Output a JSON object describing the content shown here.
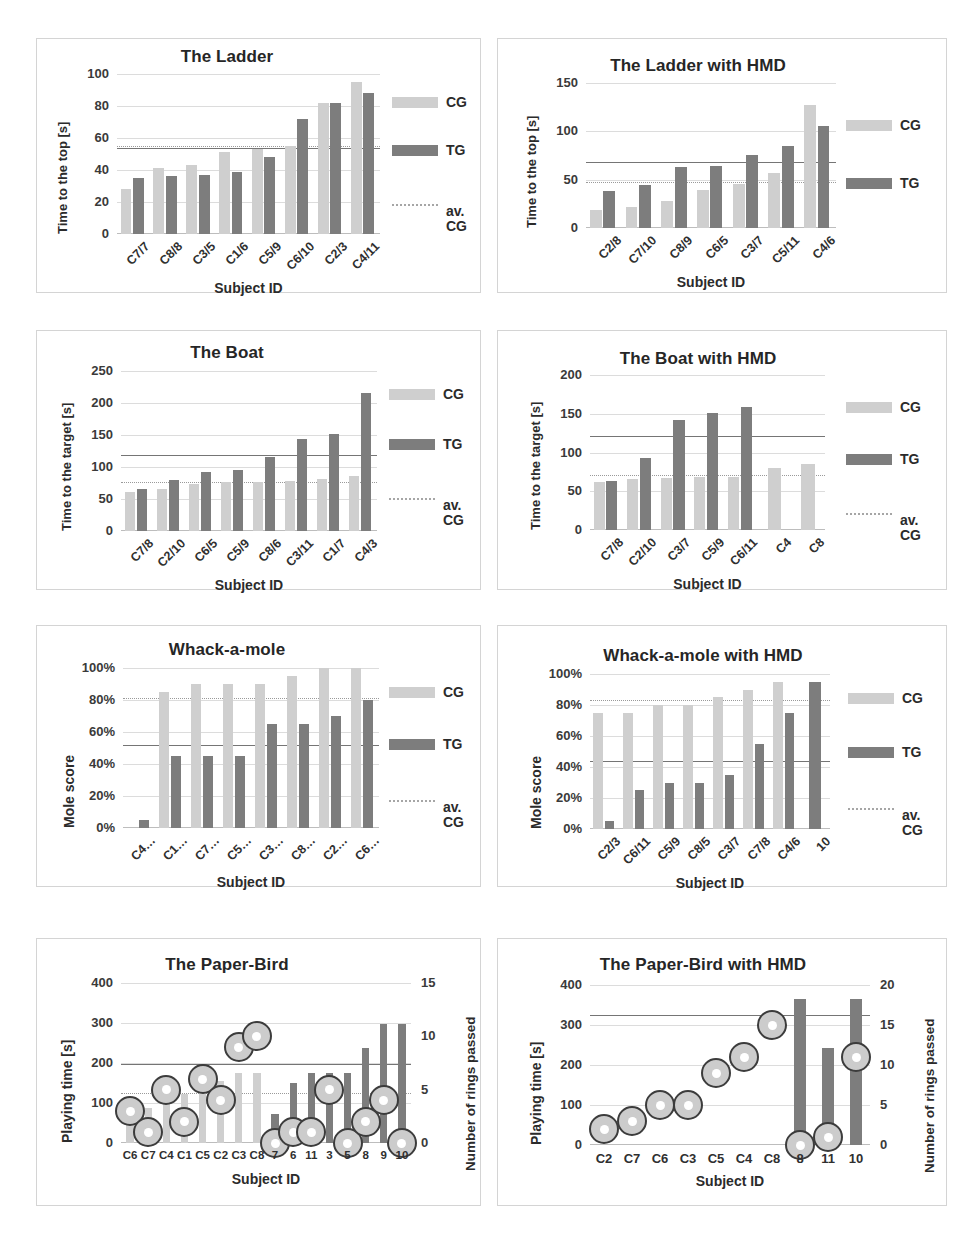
{
  "figure": {
    "panel_count": 8,
    "legend": {
      "cg_label": "CG",
      "tg_label": "TG",
      "avcg_label_line1": "av.",
      "avcg_label_line2": "CG",
      "cg_color": "#cfcfcf",
      "tg_color": "#7d7d7d",
      "avcg_color": "#a6a6a6"
    },
    "common": {
      "xlabel": "Subject ID"
    }
  },
  "chart_data": [
    {
      "id": "ladder",
      "type": "bar",
      "title": "The Ladder",
      "xlabel": "Subject ID",
      "ylabel": "Time to the top [s]",
      "ylim": [
        0,
        100
      ],
      "yticks": [
        0,
        20,
        40,
        60,
        80,
        100
      ],
      "ytick_labels": [
        "0",
        "20",
        "40",
        "60",
        "80",
        "100"
      ],
      "grid": true,
      "legend_position": "right",
      "legend_items": [
        "CG",
        "TG",
        "av. CG"
      ],
      "categories": [
        "C7/7",
        "C8/8",
        "C3/5",
        "C1/6",
        "C5/9",
        "C6/10",
        "C2/3",
        "C4/11"
      ],
      "series": [
        {
          "name": "CG",
          "color": "#cfcfcf",
          "values": [
            28,
            41,
            43,
            51,
            53,
            55,
            82,
            95
          ]
        },
        {
          "name": "TG",
          "color": "#7d7d7d",
          "values": [
            35,
            36,
            37,
            39,
            48,
            72,
            82,
            88
          ]
        }
      ],
      "reference_lines": [
        {
          "name": "av. TG",
          "value": 54,
          "style": "solid",
          "color": "#757575"
        },
        {
          "name": "av. CG",
          "value": 55,
          "style": "dotted",
          "color": "#9a9a9a"
        }
      ]
    },
    {
      "id": "ladder-hmd",
      "type": "bar",
      "title": "The Ladder with HMD",
      "xlabel": "Subject ID",
      "ylabel": "Time to the top [s]",
      "ylim": [
        0,
        150
      ],
      "yticks": [
        0,
        50,
        100,
        150
      ],
      "ytick_labels": [
        "0",
        "50",
        "100",
        "150"
      ],
      "grid": true,
      "legend_position": "right",
      "legend_items": [
        "CG",
        "TG"
      ],
      "categories": [
        "C2/8",
        "C7/10",
        "C8/9",
        "C6/5",
        "C3/7",
        "C5/11",
        "C4/6"
      ],
      "series": [
        {
          "name": "CG",
          "color": "#cfcfcf",
          "values": [
            19,
            22,
            28,
            39,
            46,
            57,
            127
          ]
        },
        {
          "name": "TG",
          "color": "#7d7d7d",
          "values": [
            38,
            45,
            63,
            64,
            76,
            85,
            106
          ]
        }
      ],
      "reference_lines": [
        {
          "name": "av. TG",
          "value": 68,
          "style": "solid",
          "color": "#757575"
        },
        {
          "name": "av. CG",
          "value": 48,
          "style": "dotted",
          "color": "#9a9a9a"
        }
      ]
    },
    {
      "id": "boat",
      "type": "bar",
      "title": "The Boat",
      "xlabel": "Subject ID",
      "ylabel": "Time to the target [s]",
      "ylim": [
        0,
        250
      ],
      "yticks": [
        0,
        50,
        100,
        150,
        200,
        250
      ],
      "ytick_labels": [
        "0",
        "50",
        "100",
        "150",
        "200",
        "250"
      ],
      "grid": true,
      "legend_position": "right",
      "legend_items": [
        "CG",
        "TG",
        "av. CG"
      ],
      "categories": [
        "C7/8",
        "C2/10",
        "C6/5",
        "C5/9",
        "C8/6",
        "C3/11",
        "C1/7",
        "C4/3"
      ],
      "series": [
        {
          "name": "CG",
          "color": "#cfcfcf",
          "values": [
            61,
            65,
            74,
            76,
            77,
            78,
            82,
            86
          ]
        },
        {
          "name": "TG",
          "color": "#7d7d7d",
          "values": [
            65,
            80,
            92,
            95,
            115,
            143,
            151,
            215
          ]
        }
      ],
      "reference_lines": [
        {
          "name": "av. TG",
          "value": 119,
          "style": "solid",
          "color": "#757575"
        },
        {
          "name": "av. CG",
          "value": 77,
          "style": "dotted",
          "color": "#9a9a9a"
        }
      ]
    },
    {
      "id": "boat-hmd",
      "type": "bar",
      "title": "The Boat with HMD",
      "xlabel": "Subject ID",
      "ylabel": "Time to the target [s]",
      "ylim": [
        0,
        200
      ],
      "yticks": [
        0,
        50,
        100,
        150,
        200
      ],
      "ytick_labels": [
        "0",
        "50",
        "100",
        "150",
        "200"
      ],
      "grid": true,
      "legend_position": "right",
      "legend_items": [
        "CG",
        "TG",
        "av. CG"
      ],
      "categories": [
        "C7/8",
        "C2/10",
        "C3/7",
        "C5/9",
        "C6/11",
        "C4",
        "C8"
      ],
      "series": [
        {
          "name": "CG",
          "color": "#cfcfcf",
          "values": [
            62,
            66,
            67,
            68,
            68,
            80,
            85
          ]
        },
        {
          "name": "TG",
          "color": "#7d7d7d",
          "values": [
            63,
            93,
            142,
            151,
            159,
            null,
            null
          ]
        }
      ],
      "reference_lines": [
        {
          "name": "av. TG",
          "value": 121,
          "style": "solid",
          "color": "#757575"
        },
        {
          "name": "av. CG",
          "value": 71,
          "style": "dotted",
          "color": "#9a9a9a"
        }
      ]
    },
    {
      "id": "whack",
      "type": "bar",
      "title": "Whack-a-mole",
      "xlabel": "Subject ID",
      "ylabel": "Mole score",
      "ylim": [
        0,
        100
      ],
      "yticks": [
        0,
        20,
        40,
        60,
        80,
        100
      ],
      "ytick_labels": [
        "0%",
        "20%",
        "40%",
        "60%",
        "80%",
        "100%"
      ],
      "grid": true,
      "legend_position": "right",
      "legend_items": [
        "CG",
        "TG",
        "av. CG"
      ],
      "categories": [
        "C4…",
        "C1…",
        "C7…",
        "C5…",
        "C3…",
        "C8…",
        "C2…",
        "C6…"
      ],
      "series": [
        {
          "name": "CG",
          "color": "#cfcfcf",
          "values": [
            0,
            85,
            90,
            90,
            90,
            95,
            100,
            100
          ]
        },
        {
          "name": "TG",
          "color": "#7d7d7d",
          "values": [
            5,
            45,
            45,
            45,
            65,
            65,
            70,
            80
          ]
        }
      ],
      "reference_lines": [
        {
          "name": "av. TG",
          "value": 52,
          "style": "solid",
          "color": "#757575"
        },
        {
          "name": "av. CG",
          "value": 81,
          "style": "dotted",
          "color": "#9a9a9a"
        }
      ]
    },
    {
      "id": "whack-hmd",
      "type": "bar",
      "title": "Whack-a-mole with HMD",
      "xlabel": "Subject ID",
      "ylabel": "Mole score",
      "ylim": [
        0,
        100
      ],
      "yticks": [
        0,
        20,
        40,
        60,
        80,
        100
      ],
      "ytick_labels": [
        "0%",
        "20%",
        "40%",
        "60%",
        "80%",
        "100%"
      ],
      "grid": true,
      "legend_position": "right",
      "legend_items": [
        "CG",
        "TG",
        "av. CG"
      ],
      "categories": [
        "C2/3",
        "C6/11",
        "C5/9",
        "C8/5",
        "C3/7",
        "C7/8",
        "C4/6",
        "10"
      ],
      "series": [
        {
          "name": "CG",
          "color": "#cfcfcf",
          "values": [
            75,
            75,
            80,
            80,
            85,
            90,
            95,
            null
          ]
        },
        {
          "name": "TG",
          "color": "#7d7d7d",
          "values": [
            5,
            25,
            30,
            30,
            35,
            55,
            75,
            95
          ]
        }
      ],
      "reference_lines": [
        {
          "name": "av. TG",
          "value": 44,
          "style": "solid",
          "color": "#757575"
        },
        {
          "name": "av. CG",
          "value": 83,
          "style": "dotted",
          "color": "#9a9a9a"
        }
      ]
    },
    {
      "id": "paperbird",
      "type": "bar",
      "title": "The Paper-Bird",
      "xlabel": "Subject ID",
      "ylabel": "Playing time [s]",
      "y2label": "Number of rings passed",
      "ylim": [
        0,
        400
      ],
      "yticks": [
        0,
        100,
        200,
        300,
        400
      ],
      "ytick_labels": [
        "0",
        "100",
        "200",
        "300",
        "400"
      ],
      "y2lim": [
        0,
        15
      ],
      "y2ticks": [
        0,
        5,
        10,
        15
      ],
      "y2tick_labels": [
        "0",
        "5",
        "10",
        "15"
      ],
      "grid": true,
      "categories": [
        "C6",
        "C7",
        "C4",
        "C1",
        "C5",
        "C2",
        "C3",
        "C8",
        "7",
        "6",
        "11",
        "3",
        "5",
        "8",
        "9",
        "10"
      ],
      "series": [
        {
          "name": "Playing time CG",
          "color": "#cfcfcf",
          "values": [
            55,
            88,
            120,
            122,
            150,
            155,
            175,
            175,
            null,
            null,
            null,
            null,
            null,
            null,
            null,
            null
          ]
        },
        {
          "name": "Playing time TG",
          "color": "#7d7d7d",
          "values": [
            null,
            null,
            null,
            null,
            null,
            null,
            null,
            null,
            72,
            150,
            175,
            175,
            175,
            238,
            298,
            298
          ]
        },
        {
          "name": "Rings passed",
          "marker": "circle",
          "values": [
            3,
            1,
            5,
            2,
            6,
            4,
            9,
            10,
            0,
            1,
            1,
            5,
            0,
            2,
            4,
            0
          ]
        }
      ],
      "reference_lines": [
        {
          "name": "av. playing time",
          "value": 198,
          "style": "solid",
          "color": "#757575"
        },
        {
          "name": "av. rings",
          "value": 125,
          "style": "dotted",
          "color": "#9a9a9a"
        }
      ]
    },
    {
      "id": "paperbird-hmd",
      "type": "bar",
      "title": "The Paper-Bird with HMD",
      "xlabel": "Subject ID",
      "ylabel": "Playing time [s]",
      "y2label": "Number of rings passed",
      "ylim": [
        0,
        400
      ],
      "yticks": [
        0,
        100,
        200,
        300,
        400
      ],
      "ytick_labels": [
        "0",
        "100",
        "200",
        "300",
        "400"
      ],
      "y2lim": [
        0,
        20
      ],
      "y2ticks": [
        0,
        5,
        10,
        15,
        20
      ],
      "y2tick_labels": [
        "0",
        "5",
        "10",
        "15",
        "20"
      ],
      "grid": true,
      "categories": [
        "C2",
        "C7",
        "C6",
        "C3",
        "C5",
        "C4",
        "C8",
        "8",
        "11",
        "10"
      ],
      "series": [
        {
          "name": "Playing time TG",
          "color": "#7d7d7d",
          "values": [
            null,
            null,
            null,
            null,
            null,
            null,
            null,
            365,
            243,
            365
          ]
        },
        {
          "name": "Rings passed",
          "marker": "circle",
          "values": [
            2,
            3,
            5,
            5,
            9,
            11,
            15,
            0,
            1,
            11
          ]
        }
      ],
      "reference_lines": [
        {
          "name": "av. playing time",
          "value": 324,
          "style": "solid",
          "color": "#757575"
        }
      ]
    }
  ]
}
